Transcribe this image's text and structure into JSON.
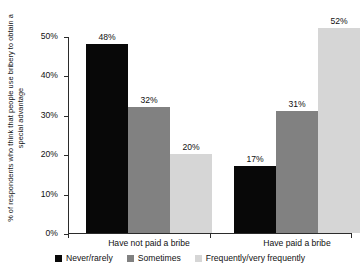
{
  "chart_data": {
    "type": "bar",
    "title": "",
    "xlabel": "",
    "ylabel": "% of respondents who think that people use bribery to obtain a special advantage",
    "ylim": [
      0,
      50
    ],
    "ytick_labels": [
      "0%",
      "10%",
      "20%",
      "30%",
      "40%",
      "50%"
    ],
    "ytick_values": [
      0,
      10,
      20,
      30,
      40,
      50
    ],
    "grid": false,
    "legend_position": "bottom",
    "categories": [
      "Have not paid a bribe",
      "Have paid a bribe"
    ],
    "series": [
      {
        "name": "Never/rarely",
        "color": "#080808",
        "values": [
          48,
          17
        ],
        "labels": [
          "48%",
          "17%"
        ]
      },
      {
        "name": "Sometimes",
        "color": "#818181",
        "values": [
          32,
          31
        ],
        "labels": [
          "32%",
          "31%"
        ]
      },
      {
        "name": "Frequently/very frequently",
        "color": "#d6d6d6",
        "values": [
          20,
          52
        ],
        "labels": [
          "20%",
          "52%"
        ]
      }
    ]
  }
}
